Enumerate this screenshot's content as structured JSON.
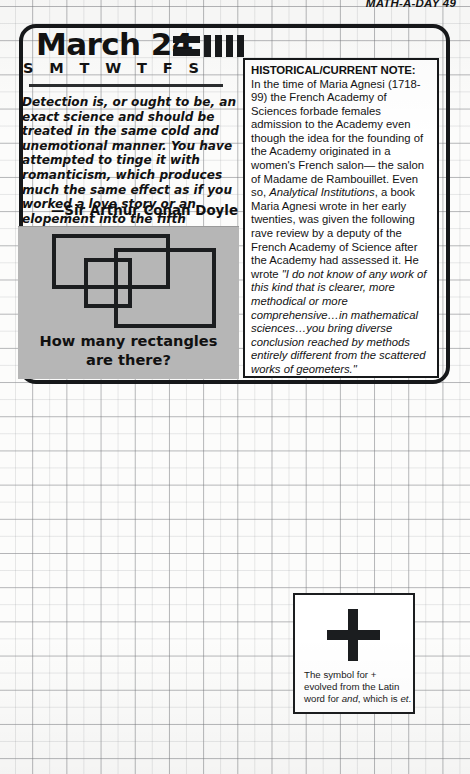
{
  "page": {
    "running_head": "MATH-A-DAY 49",
    "page_number": "49"
  },
  "calendar": {
    "date_title": "March 24",
    "weekdays": [
      "S",
      "M",
      "T",
      "W",
      "T",
      "F",
      "S"
    ],
    "marker_icon": "calendar-week-marker-icon"
  },
  "quote": {
    "text": "Detection is, or ought to be, an exact science and should be treated in the same cold and unemotional manner. You have attempted to tinge it with romanticism, which produces much the same effect as if you worked a love story or an elopement into the fifth proposition of Euclid.",
    "attribution": "—Sir Arthur Conan Doyle"
  },
  "puzzle": {
    "caption_line1": "How many rectangles",
    "caption_line2": "are there?",
    "figure_icon": "overlapping-rectangles-figure",
    "rectangle_count": 3,
    "panel_color": "#b6b6b6"
  },
  "note": {
    "title": "HISTORICAL/CURRENT NOTE:",
    "para_1a": "In the time of Maria Agnesi (1718-99) the French Academy of Sciences forbade females admission to the Academy even though the idea for the founding of the Academy originated in a women's French salon— the salon of Madame de Rambouillet. Even so, ",
    "book_title": "Analytical Institutions",
    "para_1b": ", a book Maria Agnesi wrote in her early twenties, was given the following rave review by a deputy of the French Academy of Science after the Academy had assessed it.  He wrote ",
    "review_quote": "\"I do not know of any work of this kind that is clearer, more methodical or more comprehensive…in mathematical sciences…you bring diverse conclusion reached by methods entirely different from the scattered works of geometers.\""
  },
  "plus_box": {
    "symbol": "+",
    "symbol_icon": "plus-sign-icon",
    "caption_a": "The symbol for + evolved from the Latin word for ",
    "caption_ital1": "and",
    "caption_b": ", which is ",
    "caption_ital2": "et",
    "caption_c": "."
  },
  "colors": {
    "ink": "#16181a",
    "grid_line": "#787a7e",
    "panel_gray": "#b6b6b6",
    "paper": "#fcfcfb"
  }
}
